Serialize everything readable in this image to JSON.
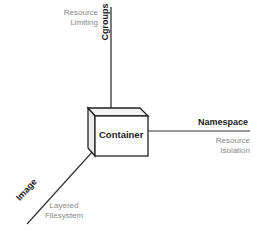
{
  "diagram": {
    "center": {
      "label": "Container"
    },
    "axes": [
      {
        "id": "cgroups",
        "title": "Cgroups",
        "subtitle_lines": [
          "Resource",
          "Limiting"
        ],
        "direction": "up"
      },
      {
        "id": "namespace",
        "title": "Namespace",
        "subtitle_lines": [
          "Resource",
          "Isolation"
        ],
        "direction": "right"
      },
      {
        "id": "image",
        "title": "Image",
        "subtitle_lines": [
          "Layered",
          "Filesystem"
        ],
        "direction": "down-left"
      }
    ],
    "colors": {
      "line": "#333333",
      "subtitle": "#888888",
      "title": "#1a1a1a"
    }
  }
}
